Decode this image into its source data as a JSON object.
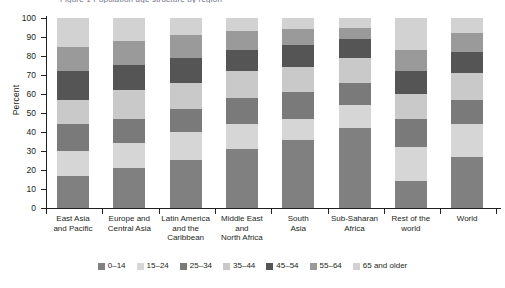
{
  "title_sliver": "Figure 1   Population age structure by region",
  "axis": {
    "ylabel": "Percent",
    "yticks": [
      0,
      10,
      20,
      30,
      40,
      50,
      60,
      70,
      80,
      90,
      100
    ],
    "ymin": 0,
    "ymax": 100
  },
  "legend": {
    "position": "bottom-center",
    "items": [
      {
        "label": "0–14",
        "color": "#808080"
      },
      {
        "label": "15–24",
        "color": "#d6d6d6"
      },
      {
        "label": "25–34",
        "color": "#7a7a7a"
      },
      {
        "label": "35–44",
        "color": "#c9c9c9"
      },
      {
        "label": "45–54",
        "color": "#555555"
      },
      {
        "label": "55–64",
        "color": "#9a9a9a"
      },
      {
        "label": "65 and older",
        "color": "#d2d2d2"
      }
    ]
  },
  "chart_data": {
    "type": "bar",
    "stacked": true,
    "title": "Figure 1   Population age structure by region",
    "xlabel": "",
    "ylabel": "Percent",
    "ylim": [
      0,
      100
    ],
    "grid": false,
    "categories": [
      "East Asia and Pacific",
      "Europe and Central Asia",
      "Latin America and the Caribbean",
      "Middle East and North Africa",
      "South Asia",
      "Sub-Saharan Africa",
      "Rest of the world",
      "World"
    ],
    "category_lines": [
      [
        "East Asia",
        "and Pacific"
      ],
      [
        "Europe and",
        "Central Asia"
      ],
      [
        "Latin America",
        "and the",
        "Caribbean"
      ],
      [
        "Middle East",
        "and",
        "North Africa"
      ],
      [
        "South",
        "Asia"
      ],
      [
        "Sub-Saharan",
        "Africa"
      ],
      [
        "Rest of the",
        "world"
      ],
      [
        "World"
      ]
    ],
    "series": [
      {
        "name": "0–14",
        "color": "#808080",
        "values": [
          17,
          21,
          25,
          31,
          36,
          42,
          14,
          27
        ]
      },
      {
        "name": "15–24",
        "color": "#d6d6d6",
        "values": [
          13,
          13,
          15,
          13,
          11,
          12,
          18,
          17
        ]
      },
      {
        "name": "25–34",
        "color": "#7a7a7a",
        "values": [
          14,
          13,
          12,
          14,
          14,
          12,
          15,
          13
        ]
      },
      {
        "name": "35–44",
        "color": "#c9c9c9",
        "values": [
          13,
          15,
          14,
          14,
          13,
          13,
          13,
          14
        ]
      },
      {
        "name": "45–54",
        "color": "#555555",
        "values": [
          15,
          13,
          13,
          11,
          12,
          10,
          12,
          11
        ]
      },
      {
        "name": "55–64",
        "color": "#9a9a9a",
        "values": [
          13,
          13,
          12,
          10,
          8,
          6,
          11,
          10
        ]
      },
      {
        "name": "65 and older",
        "color": "#d2d2d2",
        "values": [
          15,
          12,
          9,
          7,
          6,
          5,
          17,
          8
        ]
      }
    ]
  }
}
